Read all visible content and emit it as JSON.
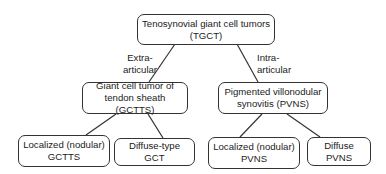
{
  "diagram": {
    "root": {
      "line1": "Tenosynovial giant cell tumors",
      "line2": "(TGCT)"
    },
    "edge_labels": {
      "left": {
        "line1": "Extra-",
        "line2": "articular"
      },
      "right": {
        "line1": "Intra-",
        "line2": "articular"
      }
    },
    "level2": [
      {
        "line1": "Giant cell tumor of",
        "line2": "tendon sheath (GCTTS)"
      },
      {
        "line1": "Pigmented villonodular",
        "line2": "synovitis (PVNS)"
      }
    ],
    "level3": [
      {
        "line1": "Localized (nodular)",
        "line2": "GCTTS"
      },
      {
        "line1": "Diffuse-type GCT",
        "line2": ""
      },
      {
        "line1": "Localized (nodular)",
        "line2": "PVNS"
      },
      {
        "line1": "Diffuse PVNS",
        "line2": ""
      }
    ]
  }
}
